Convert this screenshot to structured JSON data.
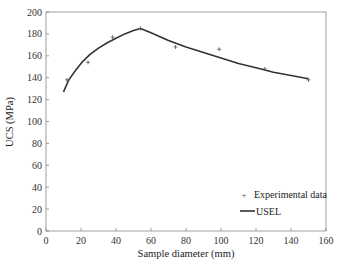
{
  "chart_data": {
    "type": "line",
    "title": "",
    "xlabel": "Sample diameter (mm)",
    "ylabel": "UCS (MPa)",
    "xlim": [
      0,
      160
    ],
    "ylim": [
      0,
      200
    ],
    "xticks": [
      0,
      20,
      40,
      60,
      80,
      100,
      120,
      140,
      160
    ],
    "yticks": [
      0,
      20,
      40,
      60,
      80,
      100,
      120,
      140,
      160,
      180,
      200
    ],
    "grid": false,
    "legend_position": "lower right",
    "series": [
      {
        "name": "Experimental data",
        "kind": "scatter",
        "marker": "+",
        "color": "#555555",
        "x": [
          12,
          24,
          38,
          54,
          74,
          99,
          125,
          150
        ],
        "y": [
          138,
          154,
          177,
          185,
          168,
          166,
          148,
          138
        ]
      },
      {
        "name": "USEL",
        "kind": "line",
        "color": "#333333",
        "x": [
          10,
          13,
          17,
          21,
          25,
          30,
          35,
          40,
          45,
          50,
          54,
          60,
          70,
          80,
          90,
          100,
          110,
          120,
          130,
          140,
          150
        ],
        "y": [
          127,
          138,
          147,
          155,
          161,
          167,
          172,
          176,
          180,
          183,
          185,
          181,
          174,
          168,
          163,
          158,
          153,
          149,
          145,
          142,
          139
        ]
      }
    ]
  }
}
